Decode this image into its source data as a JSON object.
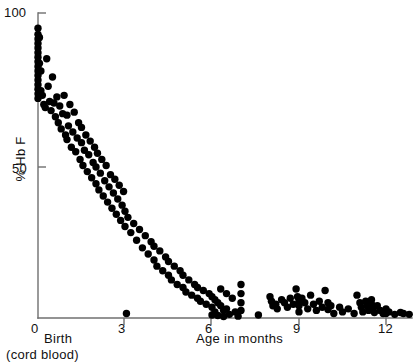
{
  "chart_data": {
    "type": "scatter",
    "title": "",
    "xlabel": "Age in months",
    "ylabel": "% Hb F",
    "xlim": [
      0,
      13
    ],
    "ylim": [
      0,
      100
    ],
    "xticks": [
      0,
      3,
      6,
      9,
      12
    ],
    "xticklabels": [
      "0",
      "3",
      "6",
      "9",
      "12"
    ],
    "yticks": [
      0,
      50,
      100
    ],
    "yticklabels": [
      "0",
      "50",
      "100"
    ],
    "grid": false,
    "legend": null,
    "annotations": [
      {
        "text": "Birth",
        "near_tick": "0"
      },
      {
        "text": "(cord blood)",
        "near_tick": "0"
      }
    ],
    "marker": {
      "shape": "circle",
      "color": "#000000",
      "size_px": 4.6
    },
    "series": [
      {
        "name": "Hb F percentage by age",
        "points": [
          [
            0.0,
            95.0
          ],
          [
            0.0,
            93.0
          ],
          [
            0.0,
            91.5
          ],
          [
            0.0,
            90.0
          ],
          [
            0.0,
            88.5
          ],
          [
            0.0,
            87.0
          ],
          [
            0.0,
            85.5
          ],
          [
            0.0,
            84.0
          ],
          [
            0.0,
            82.5
          ],
          [
            0.0,
            81.0
          ],
          [
            0.0,
            79.5
          ],
          [
            0.0,
            78.0
          ],
          [
            0.0,
            76.5
          ],
          [
            0.0,
            75.0
          ],
          [
            0.0,
            73.5
          ],
          [
            0.0,
            72.0
          ],
          [
            0.05,
            92.0
          ],
          [
            0.05,
            83.5
          ],
          [
            0.1,
            81.0
          ],
          [
            0.1,
            74.5
          ],
          [
            0.15,
            73.0
          ],
          [
            0.2,
            70.0
          ],
          [
            0.25,
            69.0
          ],
          [
            0.3,
            85.0
          ],
          [
            0.35,
            76.0
          ],
          [
            0.4,
            71.0
          ],
          [
            0.45,
            68.0
          ],
          [
            0.5,
            79.0
          ],
          [
            0.55,
            70.5
          ],
          [
            0.6,
            66.0
          ],
          [
            0.65,
            72.5
          ],
          [
            0.7,
            64.0
          ],
          [
            0.75,
            69.5
          ],
          [
            0.8,
            62.0
          ],
          [
            0.85,
            67.0
          ],
          [
            0.9,
            73.0
          ],
          [
            0.95,
            60.0
          ],
          [
            1.0,
            66.5
          ],
          [
            1.0,
            58.5
          ],
          [
            1.05,
            63.0
          ],
          [
            1.1,
            70.0
          ],
          [
            1.15,
            56.0
          ],
          [
            1.2,
            61.0
          ],
          [
            1.25,
            67.5
          ],
          [
            1.3,
            54.5
          ],
          [
            1.35,
            59.0
          ],
          [
            1.4,
            64.0
          ],
          [
            1.45,
            52.0
          ],
          [
            1.5,
            57.5
          ],
          [
            1.5,
            62.5
          ],
          [
            1.55,
            50.0
          ],
          [
            1.6,
            55.0
          ],
          [
            1.65,
            60.0
          ],
          [
            1.7,
            48.0
          ],
          [
            1.75,
            53.5
          ],
          [
            1.8,
            58.0
          ],
          [
            1.85,
            46.0
          ],
          [
            1.9,
            51.0
          ],
          [
            1.95,
            56.0
          ],
          [
            2.0,
            44.0
          ],
          [
            2.0,
            49.5
          ],
          [
            2.05,
            54.0
          ],
          [
            2.1,
            42.0
          ],
          [
            2.15,
            47.5
          ],
          [
            2.2,
            52.0
          ],
          [
            2.25,
            40.0
          ],
          [
            2.3,
            45.0
          ],
          [
            2.35,
            50.0
          ],
          [
            2.4,
            38.0
          ],
          [
            2.45,
            43.0
          ],
          [
            2.5,
            47.0
          ],
          [
            2.55,
            36.0
          ],
          [
            2.6,
            41.0
          ],
          [
            2.65,
            45.5
          ],
          [
            2.7,
            34.0
          ],
          [
            2.75,
            39.0
          ],
          [
            2.8,
            43.5
          ],
          [
            2.85,
            32.0
          ],
          [
            2.9,
            37.0
          ],
          [
            2.95,
            41.5
          ],
          [
            3.0,
            30.0
          ],
          [
            3.0,
            35.0
          ],
          [
            3.05,
            1.5
          ],
          [
            3.1,
            33.0
          ],
          [
            3.2,
            28.0
          ],
          [
            3.3,
            31.0
          ],
          [
            3.4,
            25.5
          ],
          [
            3.5,
            29.0
          ],
          [
            3.6,
            23.0
          ],
          [
            3.7,
            27.0
          ],
          [
            3.8,
            21.0
          ],
          [
            3.9,
            25.0
          ],
          [
            4.0,
            19.0
          ],
          [
            4.0,
            23.5
          ],
          [
            4.1,
            17.0
          ],
          [
            4.2,
            22.0
          ],
          [
            4.3,
            15.5
          ],
          [
            4.4,
            20.0
          ],
          [
            4.5,
            14.0
          ],
          [
            4.5,
            18.5
          ],
          [
            4.6,
            12.5
          ],
          [
            4.7,
            17.0
          ],
          [
            4.8,
            11.0
          ],
          [
            4.9,
            15.5
          ],
          [
            5.0,
            10.0
          ],
          [
            5.0,
            14.0
          ],
          [
            5.1,
            8.5
          ],
          [
            5.2,
            12.5
          ],
          [
            5.3,
            7.5
          ],
          [
            5.4,
            11.0
          ],
          [
            5.5,
            6.5
          ],
          [
            5.5,
            10.0
          ],
          [
            5.6,
            5.5
          ],
          [
            5.7,
            9.0
          ],
          [
            5.8,
            4.5
          ],
          [
            5.9,
            8.0
          ],
          [
            6.0,
            3.5
          ],
          [
            6.0,
            7.0
          ],
          [
            6.0,
            1.0
          ],
          [
            6.1,
            6.0
          ],
          [
            6.1,
            2.0
          ],
          [
            6.2,
            5.0
          ],
          [
            6.2,
            0.8
          ],
          [
            6.3,
            9.5
          ],
          [
            6.3,
            4.0
          ],
          [
            6.4,
            2.5
          ],
          [
            6.4,
            0.5
          ],
          [
            6.5,
            8.0
          ],
          [
            6.5,
            3.0
          ],
          [
            6.6,
            1.2
          ],
          [
            6.7,
            6.5
          ],
          [
            6.8,
            2.0
          ],
          [
            6.9,
            0.6
          ],
          [
            7.0,
            11.0
          ],
          [
            7.0,
            8.0
          ],
          [
            7.0,
            5.0
          ],
          [
            7.0,
            2.5
          ],
          [
            7.6,
            1.0
          ],
          [
            8.0,
            7.0
          ],
          [
            8.05,
            5.5
          ],
          [
            8.1,
            4.0
          ],
          [
            8.2,
            4.5
          ],
          [
            8.25,
            3.0
          ],
          [
            8.4,
            6.0
          ],
          [
            8.5,
            5.0
          ],
          [
            8.6,
            3.5
          ],
          [
            8.7,
            6.5
          ],
          [
            8.8,
            4.5
          ],
          [
            8.9,
            9.5
          ],
          [
            8.95,
            7.0
          ],
          [
            9.0,
            5.5
          ],
          [
            9.0,
            4.0
          ],
          [
            9.0,
            2.0
          ],
          [
            9.1,
            6.5
          ],
          [
            9.2,
            5.0
          ],
          [
            9.3,
            3.0
          ],
          [
            9.4,
            7.5
          ],
          [
            9.5,
            4.5
          ],
          [
            9.6,
            2.5
          ],
          [
            9.7,
            5.5
          ],
          [
            9.8,
            3.5
          ],
          [
            9.9,
            9.0
          ],
          [
            10.0,
            5.0
          ],
          [
            10.0,
            2.8
          ],
          [
            10.1,
            4.0
          ],
          [
            10.2,
            1.5
          ],
          [
            10.4,
            3.5
          ],
          [
            10.5,
            2.0
          ],
          [
            10.7,
            3.0
          ],
          [
            10.9,
            1.5
          ],
          [
            11.0,
            7.5
          ],
          [
            11.1,
            5.0
          ],
          [
            11.15,
            3.5
          ],
          [
            11.2,
            2.0
          ],
          [
            11.3,
            5.5
          ],
          [
            11.35,
            4.0
          ],
          [
            11.4,
            2.5
          ],
          [
            11.5,
            6.0
          ],
          [
            11.5,
            4.5
          ],
          [
            11.55,
            3.0
          ],
          [
            11.6,
            1.8
          ],
          [
            11.7,
            4.0
          ],
          [
            11.8,
            2.5
          ],
          [
            11.9,
            1.5
          ],
          [
            12.0,
            3.0
          ],
          [
            12.0,
            1.5
          ],
          [
            12.1,
            2.0
          ],
          [
            12.3,
            1.2
          ],
          [
            12.5,
            1.8
          ],
          [
            12.6,
            1.5
          ],
          [
            12.8,
            1.2
          ]
        ]
      }
    ]
  },
  "axes": {
    "y_title": "% Hb F",
    "x_title": "Age in months",
    "origin_caption_line1": "Birth",
    "origin_caption_line2": "(cord blood)"
  }
}
